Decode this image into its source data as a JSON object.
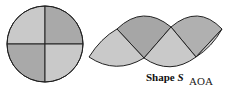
{
  "circle": {
    "quadrants": [
      "top-left",
      "top-right",
      "bottom-left",
      "bottom-right"
    ],
    "colors": {
      "light": "#c8c8c8",
      "dark": "#a9a9a9",
      "stroke": "#222222"
    }
  },
  "shape": {
    "label_prefix": "Shape ",
    "label_var": "S",
    "colors": {
      "light": "#c9c9c9",
      "dark": "#a6a6a6",
      "stroke": "#222222"
    }
  },
  "credit": "AOA"
}
